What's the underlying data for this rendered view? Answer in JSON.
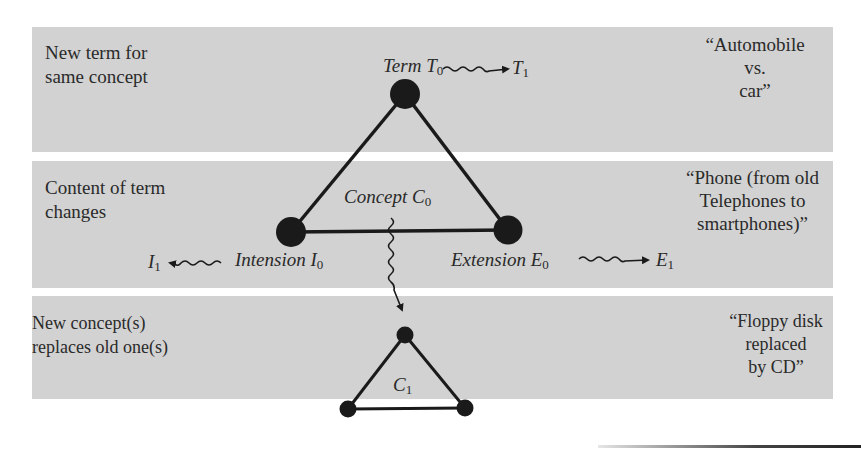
{
  "bands": [
    {
      "label_line1": "New term for",
      "label_line2": "same concept",
      "example_line1": "“Automobile",
      "example_line2": "vs.",
      "example_line3": "car”"
    },
    {
      "label_line1": "Content of term",
      "label_line2": "changes",
      "example_line1": "“Phone (from old",
      "example_line2": "Telephones to",
      "example_line3": "smartphones)”"
    },
    {
      "label_line1": "New concept(s)",
      "label_line2": "replaces old one(s)",
      "example_line1": "“Floppy disk",
      "example_line2": "replaced",
      "example_line3": "by CD”"
    }
  ],
  "nodes": {
    "term": {
      "word": "Term ",
      "symbol": "T",
      "sub": "0"
    },
    "term_new": {
      "symbol": "T",
      "sub": "1"
    },
    "concept": {
      "word": "Concept ",
      "symbol": "C",
      "sub": "0"
    },
    "intension": {
      "word": "Intension ",
      "symbol": "I",
      "sub": "0"
    },
    "intension_new": {
      "symbol": "I",
      "sub": "1"
    },
    "extension": {
      "word": "Extension ",
      "symbol": "E",
      "sub": "0"
    },
    "extension_new": {
      "symbol": "E",
      "sub": "1"
    },
    "concept_new": {
      "symbol": "C",
      "sub": "1"
    }
  },
  "colors": {
    "band_fill": "#d2d2d2",
    "ink": "#1a1a1a",
    "text": "#2a2a2a"
  }
}
